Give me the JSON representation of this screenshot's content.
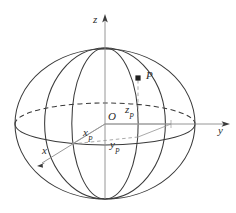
{
  "figure": {
    "kind": "sphere-coordinate-diagram",
    "background_color": "#ffffff",
    "stroke_color": "#3a3a3a",
    "axis_color": "#6e6e6e",
    "label_color": "#2b2b2b",
    "width": 236,
    "height": 213
  },
  "labels": {
    "z_axis": "z",
    "y_axis": "y",
    "x_axis": "x",
    "origin": "O",
    "point": "P",
    "x_component_base": "x",
    "x_component_sub": "P",
    "y_component_base": "y",
    "y_component_sub": "P",
    "z_component_base": "z",
    "z_component_sub": "P"
  },
  "geometry": {
    "center": {
      "x": 105,
      "y": 124
    },
    "sphere_rx": 90,
    "sphere_ry": 75,
    "pole_top": {
      "x": 105,
      "y": 48
    },
    "pole_bottom": {
      "x": 105,
      "y": 199
    },
    "point_P": {
      "x": 138,
      "y": 78
    },
    "projection_foot": {
      "x": 138,
      "y": 137
    },
    "axis_y_end": {
      "x": 229,
      "y": 124
    },
    "axis_z_end": {
      "x": 105,
      "y": 16
    },
    "axis_x_end": {
      "x": 40,
      "y": 165
    }
  }
}
